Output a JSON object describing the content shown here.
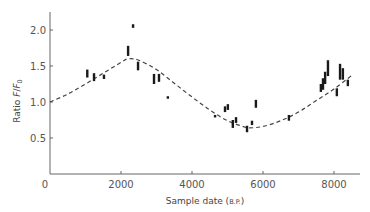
{
  "chart_data": {
    "type": "scatter",
    "title": "",
    "xlabel": "Sample date",
    "xlabel_unit": "B.P.",
    "ylabel": "Ratio F/F0",
    "xlim": [
      0,
      8700
    ],
    "ylim": [
      0,
      2.25
    ],
    "xticks": [
      0,
      2000,
      4000,
      6000,
      8000
    ],
    "xtick_labels": [
      "0",
      "2000",
      "4000",
      "6000",
      "8000"
    ],
    "yticks": [
      0.5,
      1.0,
      1.5,
      2.0
    ],
    "ytick_labels": [
      "0.5",
      "1.0",
      "1.5",
      "2.0"
    ],
    "grid": false,
    "legend": null,
    "series": [
      {
        "name": "Measurements",
        "style": "vertical error bars",
        "points": [
          {
            "x": 1050,
            "y": 1.39,
            "low": 1.34,
            "high": 1.45
          },
          {
            "x": 1240,
            "y": 1.35,
            "low": 1.29,
            "high": 1.4
          },
          {
            "x": 1520,
            "y": 1.35,
            "low": 1.32,
            "high": 1.38
          },
          {
            "x": 2200,
            "y": 1.71,
            "low": 1.64,
            "high": 1.78
          },
          {
            "x": 2340,
            "y": 2.05,
            "low": 2.03,
            "high": 2.08
          },
          {
            "x": 2480,
            "y": 1.5,
            "low": 1.44,
            "high": 1.56
          },
          {
            "x": 2930,
            "y": 1.32,
            "low": 1.25,
            "high": 1.39
          },
          {
            "x": 3070,
            "y": 1.33,
            "low": 1.28,
            "high": 1.39
          },
          {
            "x": 3320,
            "y": 1.06,
            "low": 1.05,
            "high": 1.08
          },
          {
            "x": 4650,
            "y": 0.8,
            "low": 0.79,
            "high": 0.82
          },
          {
            "x": 4930,
            "y": 0.9,
            "low": 0.86,
            "high": 0.94
          },
          {
            "x": 5010,
            "y": 0.93,
            "low": 0.89,
            "high": 0.97
          },
          {
            "x": 5150,
            "y": 0.7,
            "low": 0.64,
            "high": 0.75
          },
          {
            "x": 5240,
            "y": 0.75,
            "low": 0.71,
            "high": 0.79
          },
          {
            "x": 5550,
            "y": 0.61,
            "low": 0.58,
            "high": 0.67
          },
          {
            "x": 5690,
            "y": 0.7,
            "low": 0.68,
            "high": 0.74
          },
          {
            "x": 5800,
            "y": 0.97,
            "low": 0.92,
            "high": 1.03
          },
          {
            "x": 6730,
            "y": 0.78,
            "low": 0.74,
            "high": 0.82
          },
          {
            "x": 7630,
            "y": 1.19,
            "low": 1.14,
            "high": 1.25
          },
          {
            "x": 7690,
            "y": 1.25,
            "low": 1.17,
            "high": 1.33
          },
          {
            "x": 7750,
            "y": 1.33,
            "low": 1.25,
            "high": 1.42
          },
          {
            "x": 7830,
            "y": 1.47,
            "low": 1.36,
            "high": 1.58
          },
          {
            "x": 8080,
            "y": 1.14,
            "low": 1.08,
            "high": 1.19
          },
          {
            "x": 8170,
            "y": 1.42,
            "low": 1.31,
            "high": 1.53
          },
          {
            "x": 8250,
            "y": 1.4,
            "low": 1.31,
            "high": 1.47
          },
          {
            "x": 8390,
            "y": 1.25,
            "low": 1.22,
            "high": 1.31
          }
        ]
      },
      {
        "name": "Fitted curve",
        "style": "dashed line",
        "x": [
          0,
          500,
          1000,
          1500,
          2000,
          2200,
          2500,
          3000,
          3500,
          4000,
          4500,
          5000,
          5500,
          5600,
          6000,
          6500,
          7000,
          7500,
          8000,
          8500
        ],
        "values": [
          1.0,
          1.11,
          1.25,
          1.4,
          1.55,
          1.6,
          1.58,
          1.45,
          1.26,
          1.07,
          0.89,
          0.74,
          0.65,
          0.64,
          0.66,
          0.74,
          0.86,
          1.02,
          1.18,
          1.37
        ]
      }
    ]
  }
}
